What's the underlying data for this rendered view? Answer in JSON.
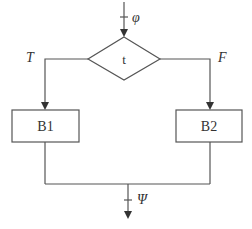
{
  "diagram": {
    "type": "flowchart-if-then-else",
    "input_label": "φ",
    "output_label": "Ψ",
    "condition": {
      "label": "t"
    },
    "true_branch": {
      "edge_label": "T",
      "block_label": "B1"
    },
    "false_branch": {
      "edge_label": "F",
      "block_label": "B2"
    },
    "colors": {
      "stroke": "#555555",
      "text": "#333333",
      "background": "#ffffff"
    }
  }
}
